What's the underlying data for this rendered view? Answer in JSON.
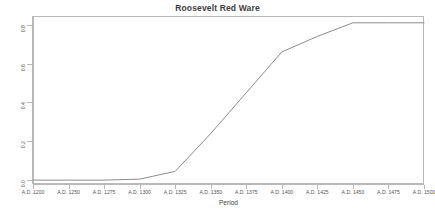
{
  "chart_data": {
    "type": "line",
    "title": "Roosevelt Red Ware",
    "xlabel": "Period",
    "ylabel": "Cumulative Adoption",
    "categories": [
      "A.D. 1200",
      "A.D. 1250",
      "A.D. 1275",
      "A.D. 1300",
      "A.D. 1325",
      "A.D. 1350",
      "A.D. 1375",
      "A.D. 1400",
      "A.D. 1425",
      "A.D. 1450",
      "A.D. 1475",
      "A.D. 1500"
    ],
    "values": [
      0.0,
      0.0,
      0.0,
      0.005,
      0.045,
      0.24,
      0.45,
      0.66,
      0.74,
      0.81,
      0.81,
      0.81
    ],
    "series": [
      {
        "name": "Cumulative Adoption",
        "values": [
          0.0,
          0.0,
          0.0,
          0.005,
          0.045,
          0.24,
          0.45,
          0.66,
          0.74,
          0.81,
          0.81,
          0.81
        ]
      }
    ],
    "ytick_labels": [
      "0.0",
      "0.2",
      "0.4",
      "0.6",
      "0.8"
    ],
    "ytick_values": [
      0.0,
      0.2,
      0.4,
      0.6,
      0.8
    ],
    "ylim": [
      -0.02,
      0.845
    ],
    "xlim": [
      0,
      11
    ],
    "grid": false,
    "legend": false,
    "line_color": "#8c8c8c",
    "frame_color": "#b9b9b9",
    "background": "#ffffff"
  }
}
